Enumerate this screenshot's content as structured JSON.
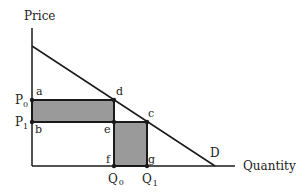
{
  "diagram": {
    "type": "economics-demand-curve",
    "y_axis_label": "Price",
    "x_axis_label": "Quantity",
    "curve_label": "D",
    "price_levels": [
      {
        "label": "P",
        "sub": "0"
      },
      {
        "label": "P",
        "sub": "1"
      }
    ],
    "quantity_levels": [
      {
        "label": "Q",
        "sub": "0"
      },
      {
        "label": "Q",
        "sub": "1"
      }
    ],
    "points": {
      "a": "a",
      "b": "b",
      "c": "c",
      "d": "d",
      "e": "e",
      "f": "f",
      "g": "g"
    },
    "shaded_regions": [
      {
        "name": "abed",
        "description": "Rectangle between P0 and P1 from price axis to Q0"
      },
      {
        "name": "efgc",
        "description": "Rectangle between Q0 and Q1 from quantity axis to P1"
      }
    ],
    "colors": {
      "line": "#1a1a1a",
      "shade": "#9a9a9a",
      "background": "#ffffff"
    }
  }
}
